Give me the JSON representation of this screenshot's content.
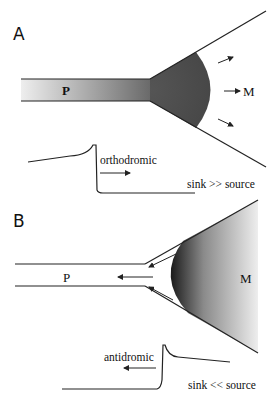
{
  "figure": {
    "panels": [
      {
        "id": "A",
        "label": "A",
        "process_label": "P",
        "target_label": "M",
        "direction_label": "orthodromic",
        "ratio_label": "sink >> source"
      },
      {
        "id": "B",
        "label": "B",
        "process_label": "P",
        "target_label": "M",
        "direction_label": "antidromic",
        "ratio_label": "sink << source"
      }
    ],
    "colors": {
      "stroke": "#222222",
      "dark_fill": "#3a3a3a",
      "light_fill": "#f2f2f2"
    }
  }
}
